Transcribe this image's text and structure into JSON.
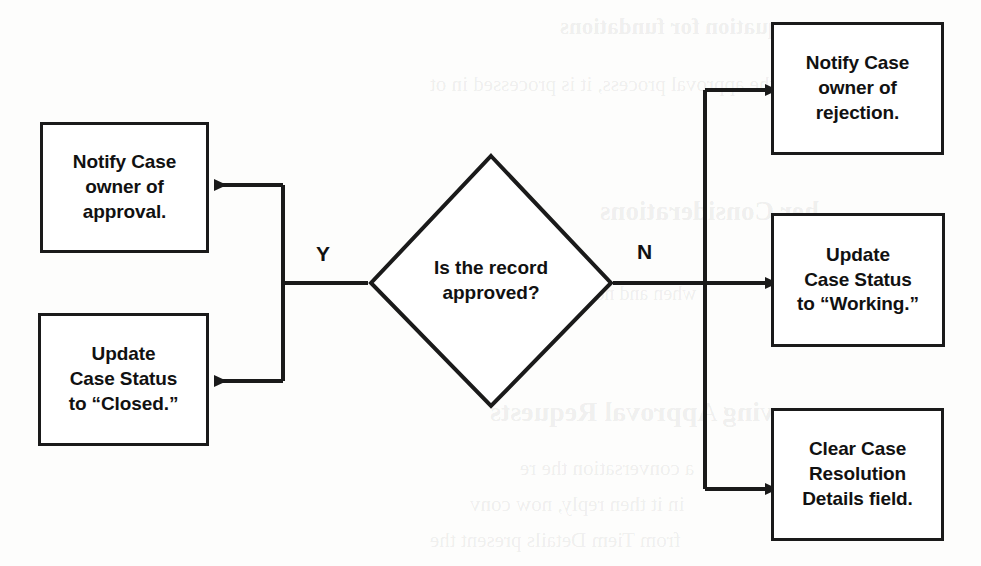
{
  "diagram": {
    "line_color": "#1a1a1a",
    "text_color": "#111111",
    "background_color": "#fdfdfc"
  },
  "decision": {
    "id": "is-record-approved",
    "text": "Is the record\napproved?",
    "shape": "diamond"
  },
  "branches": {
    "yes_label": "Y",
    "no_label": "N"
  },
  "yes_nodes": [
    {
      "id": "notify-approval",
      "text": "Notify Case\nowner of\napproval."
    },
    {
      "id": "update-status-closed",
      "text": "Update\nCase Status\nto “Closed.”"
    }
  ],
  "no_nodes": [
    {
      "id": "notify-rejection",
      "text": "Notify Case\nowner of\nrejection."
    },
    {
      "id": "update-status-working",
      "text": "Update\nCase Status\nto “Working.”"
    },
    {
      "id": "clear-resolution-details",
      "text": "Clear Case\nResolution\nDetails field."
    }
  ],
  "background_bleed": [
    {
      "text": "equation for fundations",
      "x": 560,
      "y": 14,
      "size": 23,
      "bold": true
    },
    {
      "text": "the approval process, it is processed in ot",
      "x": 430,
      "y": 72,
      "size": 21,
      "bold": false
    },
    {
      "text": "her Considerations",
      "x": 600,
      "y": 196,
      "size": 27,
      "bold": true
    },
    {
      "text": "when and no approval proce",
      "x": 470,
      "y": 282,
      "size": 20,
      "bold": false
    },
    {
      "text": "ving Approval Requests",
      "x": 490,
      "y": 396,
      "size": 28,
      "bold": true
    },
    {
      "text": "a conversation the re",
      "x": 520,
      "y": 456,
      "size": 21,
      "bold": false
    },
    {
      "text": "in it then reply, now conv",
      "x": 470,
      "y": 492,
      "size": 21,
      "bold": false
    },
    {
      "text": "from Tiem Details present the",
      "x": 430,
      "y": 528,
      "size": 21,
      "bold": false
    }
  ]
}
